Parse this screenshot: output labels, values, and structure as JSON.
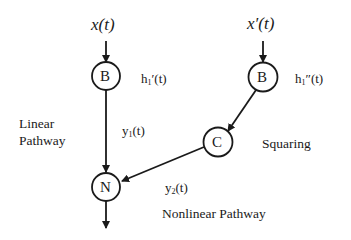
{
  "diagram": {
    "inputs": {
      "left": {
        "label": "x(t)"
      },
      "right": {
        "label": "x′(t)"
      }
    },
    "nodes": {
      "b_left": {
        "letter": "B",
        "annotation_base": "h",
        "annotation_sub": "1",
        "annotation_suffix": "′(t)"
      },
      "b_right": {
        "letter": "B",
        "annotation_base": "h",
        "annotation_sub": "1",
        "annotation_suffix": "″(t)"
      },
      "c": {
        "letter": "C",
        "annotation": "Squaring"
      },
      "n": {
        "letter": "N"
      }
    },
    "edges": {
      "y1": {
        "base": "y",
        "sub": "1",
        "suffix": "(t)"
      },
      "y2": {
        "base": "y",
        "sub": "2",
        "suffix": "(t)"
      }
    },
    "pathways": {
      "linear_line1": "Linear",
      "linear_line2": "Pathway",
      "nonlinear": "Nonlinear Pathway"
    },
    "colors": {
      "stroke": "#1a1a1a",
      "background": "#ffffff"
    }
  }
}
